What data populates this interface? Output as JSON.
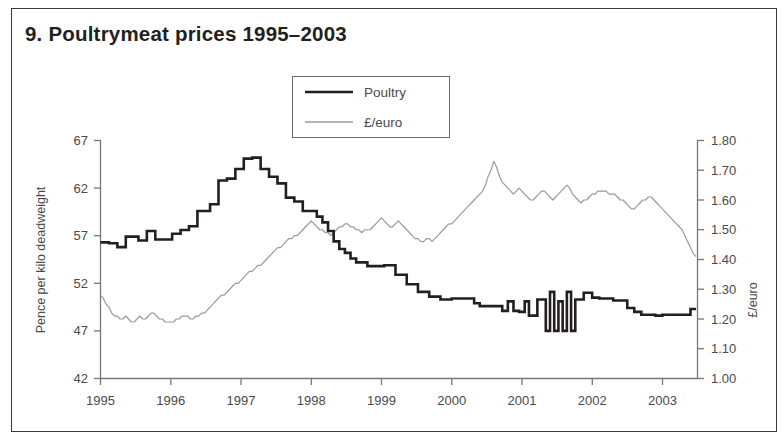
{
  "figure": {
    "title": "9. Poultrymeat prices 1995–2003",
    "border_color": "#3a3a3a",
    "background": "#ffffff"
  },
  "legend": {
    "position": "top-center",
    "entries": [
      {
        "label": "Poultry",
        "color": "#231f20",
        "width": 2.6,
        "key": "poultry-swatch"
      },
      {
        "label": "£/euro",
        "color": "#9a9a9a",
        "width": 1.2,
        "key": "euro-swatch"
      }
    ]
  },
  "axes": {
    "left": {
      "label": "Pence per kilo deadweight",
      "ticks": [
        "42",
        "47",
        "52",
        "57",
        "62",
        "67"
      ],
      "min": 42,
      "max": 67
    },
    "right": {
      "label": "£/euro",
      "ticks": [
        "1.00",
        "1.10",
        "1.20",
        "1.30",
        "1.40",
        "1.50",
        "1.60",
        "1.70",
        "1.80"
      ],
      "min": 1.0,
      "max": 1.8
    },
    "bottom": {
      "label": "",
      "ticks": [
        "1995",
        "1996",
        "1997",
        "1998",
        "1999",
        "2000",
        "2001",
        "2002",
        "2003"
      ]
    }
  },
  "chart_data": {
    "type": "line",
    "title": "9. Poultrymeat prices 1995–2003",
    "xlabel": "",
    "ylabel": "Pence per kilo deadweight",
    "y2label": "£/euro",
    "grid": false,
    "legend_position": "top-center",
    "xlim": [
      1995.0,
      2003.5
    ],
    "ylim": [
      42,
      67
    ],
    "y2lim": [
      1.0,
      1.8
    ],
    "xticks": [
      1995,
      1996,
      1997,
      1998,
      1999,
      2000,
      2001,
      2002,
      2003
    ],
    "xticklabels": [
      "1995",
      "1996",
      "1997",
      "1998",
      "1999",
      "2000",
      "2001",
      "2002",
      "2003"
    ],
    "yticks": [
      42,
      47,
      52,
      57,
      62,
      67
    ],
    "y2ticks": [
      1.0,
      1.1,
      1.2,
      1.3,
      1.4,
      1.5,
      1.6,
      1.7,
      1.8
    ],
    "series": [
      {
        "name": "Poultry",
        "axis": "left",
        "color": "#231f20",
        "units": "pence per kilo deadweight",
        "x": [
          1995.0,
          1995.06,
          1995.12,
          1995.18,
          1995.24,
          1995.3,
          1995.36,
          1995.42,
          1995.48,
          1995.54,
          1995.6,
          1995.66,
          1995.72,
          1995.78,
          1995.84,
          1995.9,
          1995.96,
          1996.02,
          1996.08,
          1996.14,
          1996.2,
          1996.26,
          1996.32,
          1996.38,
          1996.44,
          1996.5,
          1996.56,
          1996.62,
          1996.68,
          1996.74,
          1996.8,
          1996.86,
          1996.92,
          1996.98,
          1997.04,
          1997.1,
          1997.16,
          1997.22,
          1997.28,
          1997.34,
          1997.4,
          1997.46,
          1997.52,
          1997.58,
          1997.64,
          1997.7,
          1997.76,
          1997.82,
          1997.88,
          1997.94,
          1998.0,
          1998.08,
          1998.16,
          1998.24,
          1998.32,
          1998.4,
          1998.48,
          1998.56,
          1998.64,
          1998.72,
          1998.8,
          1998.88,
          1998.96,
          1999.04,
          1999.12,
          1999.2,
          1999.28,
          1999.36,
          1999.44,
          1999.52,
          1999.6,
          1999.68,
          1999.76,
          1999.84,
          1999.92,
          2000.0,
          2000.08,
          2000.16,
          2000.24,
          2000.32,
          2000.4,
          2000.48,
          2000.56,
          2000.64,
          2000.72,
          2000.8,
          2000.88,
          2000.96,
          2001.04,
          2001.1,
          2001.16,
          2001.22,
          2001.28,
          2001.34,
          2001.4,
          2001.46,
          2001.52,
          2001.58,
          2001.64,
          2001.7,
          2001.76,
          2001.82,
          2001.88,
          2001.94,
          2002.0,
          2002.1,
          2002.2,
          2002.3,
          2002.4,
          2002.5,
          2002.6,
          2002.7,
          2002.8,
          2002.9,
          2003.0,
          2003.1,
          2003.2,
          2003.3,
          2003.4,
          2003.48
        ],
        "y": [
          56.3,
          56.3,
          56.2,
          56.2,
          55.8,
          55.8,
          56.9,
          56.9,
          56.9,
          56.5,
          56.5,
          57.5,
          57.5,
          56.6,
          56.6,
          56.6,
          56.6,
          57.2,
          57.2,
          57.6,
          57.6,
          58.0,
          58.0,
          59.6,
          59.6,
          59.6,
          60.3,
          60.3,
          62.8,
          62.8,
          63.0,
          63.0,
          64.0,
          64.0,
          65.1,
          65.1,
          65.2,
          65.2,
          64.0,
          64.0,
          63.2,
          63.2,
          62.5,
          62.5,
          61.0,
          61.0,
          60.6,
          60.6,
          59.6,
          59.6,
          59.6,
          59.0,
          58.4,
          57.5,
          56.4,
          55.6,
          55.2,
          54.6,
          54.2,
          54.2,
          53.8,
          53.8,
          53.8,
          53.9,
          53.9,
          52.9,
          52.9,
          51.9,
          51.9,
          51.1,
          51.1,
          50.6,
          50.6,
          50.3,
          50.3,
          50.4,
          50.4,
          50.4,
          50.4,
          49.9,
          49.6,
          49.6,
          49.6,
          49.6,
          49.1,
          50.1,
          49.1,
          49.0,
          50.1,
          48.6,
          48.6,
          50.3,
          50.3,
          47.0,
          51.1,
          47.0,
          50.1,
          47.0,
          51.1,
          47.0,
          50.3,
          50.3,
          51.0,
          51.0,
          50.5,
          50.4,
          50.4,
          50.2,
          50.2,
          49.4,
          49.0,
          48.7,
          48.7,
          48.6,
          48.7,
          48.7,
          48.7,
          48.7,
          49.3,
          49.3
        ],
        "notes": "Thick black stepped line; starts near 56p, peaks ~65p in late 1996, falls sharply through 1997–1999, highly volatile spikes in 2001, ends ~49p in 2003."
      },
      {
        "name": "£/euro",
        "axis": "right",
        "color": "#9a9a9a",
        "units": "£/euro exchange rate",
        "x": [
          1995.0,
          1995.04,
          1995.08,
          1995.12,
          1995.16,
          1995.2,
          1995.24,
          1995.28,
          1995.32,
          1995.36,
          1995.4,
          1995.44,
          1995.48,
          1995.52,
          1995.56,
          1995.6,
          1995.64,
          1995.68,
          1995.72,
          1995.76,
          1995.8,
          1995.84,
          1995.88,
          1995.92,
          1995.96,
          1996.0,
          1996.04,
          1996.08,
          1996.12,
          1996.16,
          1996.2,
          1996.24,
          1996.28,
          1996.32,
          1996.36,
          1996.4,
          1996.44,
          1996.48,
          1996.52,
          1996.56,
          1996.6,
          1996.64,
          1996.68,
          1996.72,
          1996.76,
          1996.8,
          1996.84,
          1996.88,
          1996.92,
          1996.96,
          1997.0,
          1997.04,
          1997.08,
          1997.12,
          1997.16,
          1997.2,
          1997.24,
          1997.28,
          1997.32,
          1997.36,
          1997.4,
          1997.44,
          1997.48,
          1997.52,
          1997.56,
          1997.6,
          1997.64,
          1997.68,
          1997.72,
          1997.76,
          1997.8,
          1997.84,
          1997.88,
          1997.92,
          1997.96,
          1998.0,
          1998.04,
          1998.08,
          1998.12,
          1998.16,
          1998.2,
          1998.24,
          1998.28,
          1998.32,
          1998.36,
          1998.4,
          1998.44,
          1998.48,
          1998.52,
          1998.56,
          1998.6,
          1998.64,
          1998.68,
          1998.72,
          1998.76,
          1998.8,
          1998.84,
          1998.88,
          1998.92,
          1998.96,
          1999.0,
          1999.04,
          1999.08,
          1999.12,
          1999.16,
          1999.2,
          1999.24,
          1999.28,
          1999.32,
          1999.36,
          1999.4,
          1999.44,
          1999.48,
          1999.52,
          1999.56,
          1999.6,
          1999.64,
          1999.68,
          1999.72,
          1999.76,
          1999.8,
          1999.84,
          1999.88,
          1999.92,
          1999.96,
          2000.0,
          2000.04,
          2000.08,
          2000.12,
          2000.16,
          2000.2,
          2000.24,
          2000.28,
          2000.32,
          2000.36,
          2000.4,
          2000.44,
          2000.48,
          2000.52,
          2000.56,
          2000.6,
          2000.64,
          2000.68,
          2000.72,
          2000.76,
          2000.8,
          2000.84,
          2000.88,
          2000.92,
          2000.96,
          2001.0,
          2001.04,
          2001.08,
          2001.12,
          2001.16,
          2001.2,
          2001.24,
          2001.28,
          2001.32,
          2001.36,
          2001.4,
          2001.44,
          2001.48,
          2001.52,
          2001.56,
          2001.6,
          2001.64,
          2001.68,
          2001.72,
          2001.76,
          2001.8,
          2001.84,
          2001.88,
          2001.92,
          2001.96,
          2002.0,
          2002.04,
          2002.08,
          2002.12,
          2002.16,
          2002.2,
          2002.24,
          2002.28,
          2002.32,
          2002.36,
          2002.4,
          2002.44,
          2002.48,
          2002.52,
          2002.56,
          2002.6,
          2002.64,
          2002.68,
          2002.72,
          2002.76,
          2002.8,
          2002.84,
          2002.88,
          2002.92,
          2002.96,
          2003.0,
          2003.04,
          2003.08,
          2003.12,
          2003.16,
          2003.2,
          2003.24,
          2003.28,
          2003.32,
          2003.36,
          2003.4,
          2003.44,
          2003.48
        ],
        "y": [
          1.28,
          1.27,
          1.25,
          1.24,
          1.22,
          1.21,
          1.21,
          1.2,
          1.2,
          1.21,
          1.2,
          1.19,
          1.19,
          1.2,
          1.21,
          1.2,
          1.2,
          1.21,
          1.22,
          1.22,
          1.21,
          1.2,
          1.2,
          1.19,
          1.19,
          1.19,
          1.19,
          1.2,
          1.2,
          1.21,
          1.21,
          1.21,
          1.2,
          1.2,
          1.21,
          1.21,
          1.22,
          1.22,
          1.23,
          1.24,
          1.25,
          1.26,
          1.27,
          1.28,
          1.28,
          1.29,
          1.3,
          1.31,
          1.32,
          1.32,
          1.33,
          1.34,
          1.35,
          1.36,
          1.36,
          1.37,
          1.38,
          1.38,
          1.39,
          1.4,
          1.41,
          1.42,
          1.43,
          1.44,
          1.44,
          1.45,
          1.46,
          1.47,
          1.47,
          1.48,
          1.48,
          1.49,
          1.5,
          1.51,
          1.52,
          1.53,
          1.52,
          1.51,
          1.5,
          1.5,
          1.49,
          1.49,
          1.48,
          1.49,
          1.5,
          1.51,
          1.51,
          1.52,
          1.52,
          1.51,
          1.51,
          1.5,
          1.5,
          1.49,
          1.5,
          1.5,
          1.5,
          1.51,
          1.52,
          1.53,
          1.54,
          1.53,
          1.52,
          1.51,
          1.51,
          1.52,
          1.53,
          1.52,
          1.51,
          1.5,
          1.49,
          1.48,
          1.47,
          1.47,
          1.46,
          1.46,
          1.47,
          1.47,
          1.46,
          1.47,
          1.48,
          1.49,
          1.5,
          1.51,
          1.52,
          1.52,
          1.53,
          1.54,
          1.55,
          1.56,
          1.57,
          1.58,
          1.59,
          1.6,
          1.61,
          1.62,
          1.63,
          1.65,
          1.68,
          1.7,
          1.73,
          1.71,
          1.68,
          1.66,
          1.65,
          1.64,
          1.63,
          1.62,
          1.63,
          1.64,
          1.63,
          1.62,
          1.61,
          1.6,
          1.6,
          1.61,
          1.62,
          1.63,
          1.63,
          1.62,
          1.61,
          1.6,
          1.61,
          1.62,
          1.63,
          1.64,
          1.65,
          1.64,
          1.62,
          1.61,
          1.6,
          1.59,
          1.6,
          1.6,
          1.61,
          1.62,
          1.62,
          1.63,
          1.63,
          1.63,
          1.63,
          1.62,
          1.62,
          1.62,
          1.61,
          1.6,
          1.6,
          1.59,
          1.58,
          1.57,
          1.57,
          1.58,
          1.59,
          1.6,
          1.6,
          1.61,
          1.61,
          1.6,
          1.59,
          1.58,
          1.57,
          1.56,
          1.55,
          1.54,
          1.53,
          1.52,
          1.51,
          1.5,
          1.48,
          1.46,
          1.44,
          1.42,
          1.41
        ],
        "notes": "Thin grey line; starts ~1.28, dips to ~1.19 through 1995–1996, rises steeply to ~1.53 in early 1998, peaks ~1.73 in mid-2000, eases back to ~1.41 by mid-2003."
      }
    ]
  }
}
